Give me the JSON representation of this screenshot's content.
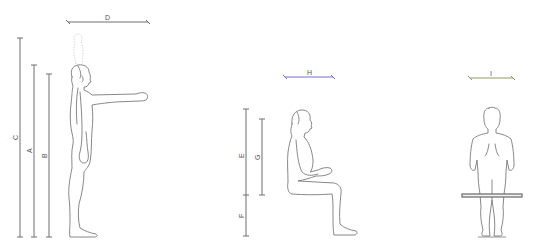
{
  "diagram": {
    "type": "anthropometric-dimensions",
    "colors": {
      "dimension_line": "#6e6e6e",
      "dimension_H": "#7b6fd0",
      "dimension_I": "#8a9a6a",
      "figure_outline": "#7a7a7a",
      "label": "#555555"
    },
    "figures": [
      {
        "name": "standing-side-view",
        "pose": "standing, arm extended forward"
      },
      {
        "name": "seated-side-view",
        "pose": "seated, hands in lap"
      },
      {
        "name": "seated-back-view",
        "pose": "seated on bench, viewed from behind"
      }
    ],
    "dimensions": [
      {
        "label": "D",
        "orientation": "horizontal",
        "figure": "standing-side-view",
        "measures": "forward reach"
      },
      {
        "label": "C",
        "orientation": "vertical",
        "figure": "standing-side-view",
        "measures": "vertical reach"
      },
      {
        "label": "A",
        "orientation": "vertical",
        "figure": "standing-side-view",
        "measures": "stature"
      },
      {
        "label": "B",
        "orientation": "vertical",
        "figure": "standing-side-view",
        "measures": "eye height"
      },
      {
        "label": "H",
        "orientation": "horizontal",
        "figure": "seated-side-view",
        "measures": "seated depth"
      },
      {
        "label": "E",
        "orientation": "vertical",
        "figure": "seated-side-view",
        "measures": "sitting height"
      },
      {
        "label": "G",
        "orientation": "vertical",
        "figure": "seated-side-view",
        "measures": "seated eye height"
      },
      {
        "label": "F",
        "orientation": "vertical",
        "figure": "seated-side-view",
        "measures": "seat height"
      },
      {
        "label": "I",
        "orientation": "horizontal",
        "figure": "seated-back-view",
        "measures": "shoulder breadth"
      }
    ]
  },
  "labels": {
    "D": "D",
    "C": "C",
    "A": "A",
    "B": "B",
    "H": "H",
    "E": "E",
    "G": "G",
    "F": "F",
    "I": "I"
  }
}
